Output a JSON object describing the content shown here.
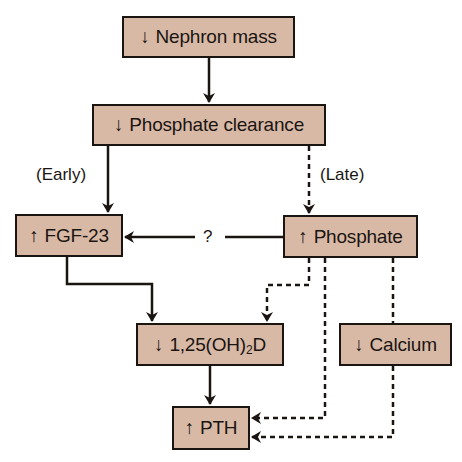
{
  "diagram": {
    "title": "",
    "colors": {
      "box_fill": "#d8b9a6",
      "stroke": "#1b1512",
      "background": "#ffffff"
    },
    "nodes": [
      {
        "id": "nephron",
        "arrow": "↓",
        "label": "Nephron mass"
      },
      {
        "id": "clearance",
        "arrow": "↓",
        "label": "Phosphate clearance"
      },
      {
        "id": "fgf23",
        "arrow": "↑",
        "label": "FGF-23"
      },
      {
        "id": "phosphate",
        "arrow": "↑",
        "label": "Phosphate"
      },
      {
        "id": "vitd",
        "arrow": "↓",
        "label_prefix": "1,25(OH)",
        "label_sub": "2",
        "label_suffix": "D"
      },
      {
        "id": "calcium",
        "arrow": "↓",
        "label": "Calcium"
      },
      {
        "id": "pth",
        "arrow": "↑",
        "label": "PTH"
      }
    ],
    "edge_labels": {
      "early": "(Early)",
      "late": "(Late)",
      "question": "?"
    },
    "edges": [
      {
        "from": "nephron",
        "to": "clearance",
        "style": "solid"
      },
      {
        "from": "clearance",
        "to": "fgf23",
        "style": "solid",
        "label": "(Early)"
      },
      {
        "from": "clearance",
        "to": "phosphate",
        "style": "dashed",
        "label": "(Late)"
      },
      {
        "from": "phosphate",
        "to": "fgf23",
        "style": "solid",
        "label": "?"
      },
      {
        "from": "fgf23",
        "to": "vitd",
        "style": "solid"
      },
      {
        "from": "phosphate",
        "to": "vitd",
        "style": "dashed"
      },
      {
        "from": "phosphate",
        "to": "pth",
        "style": "dashed"
      },
      {
        "from": "calcium",
        "to": "pth",
        "style": "dashed"
      },
      {
        "from": "vitd",
        "to": "pth",
        "style": "solid"
      }
    ]
  }
}
